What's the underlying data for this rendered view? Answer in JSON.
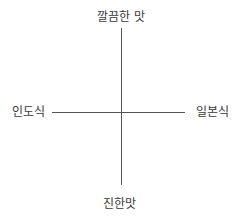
{
  "diagram": {
    "type": "quadrant",
    "axes": {
      "vertical": {
        "top_label": "깔끔한 맛",
        "bottom_label": "진한맛"
      },
      "horizontal": {
        "left_label": "인도식",
        "right_label": "일본식"
      }
    },
    "colors": {
      "axis": "#555555",
      "text": "#3a3a3a",
      "background": "#ffffff"
    }
  }
}
